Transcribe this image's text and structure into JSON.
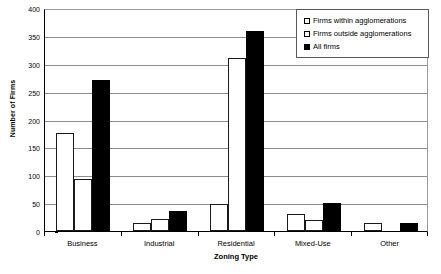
{
  "chart_data": {
    "type": "bar",
    "title": "",
    "xlabel": "Zoning Type",
    "ylabel": "Number of Firms",
    "categories": [
      "Business",
      "Industrial",
      "Residential",
      "Mixed-Use",
      "Other"
    ],
    "series": [
      {
        "name": "Firms within agglomerations",
        "swatch": "open",
        "values": [
          176,
          15,
          48,
          31,
          15
        ]
      },
      {
        "name": "Firms outside agglomerations",
        "swatch": "open",
        "values": [
          94,
          21,
          310,
          19,
          0
        ]
      },
      {
        "name": "All firms",
        "swatch": "filled",
        "values": [
          270,
          36,
          358,
          50,
          15
        ]
      }
    ],
    "ylim": [
      0,
      400
    ],
    "yticks": [
      0,
      50,
      100,
      150,
      200,
      250,
      300,
      350,
      400
    ],
    "ytick_labels": [
      "0",
      "50",
      "100",
      "150",
      "200",
      "250",
      "300",
      "350",
      "400"
    ],
    "grid": "horizontal",
    "legend_position": "top-right",
    "colors": {
      "series_open_fill": "#ffffff",
      "series_open_border": "#1a1a1a",
      "series_filled": "#000000",
      "gridline": "#8c8c8c",
      "axis": "#000000",
      "background": "#ffffff"
    }
  },
  "legend": {
    "items": [
      {
        "label": "Firms within agglomerations",
        "swatch": "open"
      },
      {
        "label": "Firms outside agglomerations",
        "swatch": "open"
      },
      {
        "label": "All firms",
        "swatch": "filled"
      }
    ]
  }
}
